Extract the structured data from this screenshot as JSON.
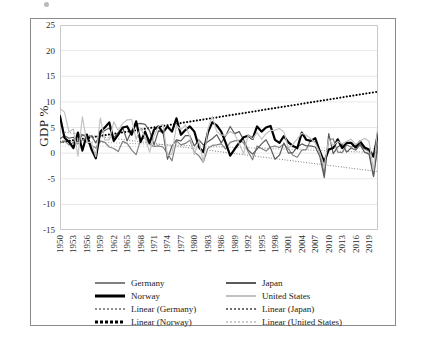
{
  "figure": {
    "ylabel": "GDP %",
    "title": ""
  },
  "chart_data": {
    "type": "line",
    "title": "",
    "xlabel": "",
    "ylabel": "GDP %",
    "ylim": [
      -15,
      25
    ],
    "ytick_values": [
      25,
      20,
      15,
      10,
      5,
      0,
      -5,
      -10,
      -15
    ],
    "ytick_labels": [
      "25",
      "20",
      "15",
      "10",
      "5",
      "0",
      "-5",
      "-10",
      "-15"
    ],
    "grid": "horizontal",
    "legend_position": "below",
    "x_start": 1950,
    "x_end": 2021,
    "xtick_labels": [
      "1950",
      "1953",
      "1956",
      "1959",
      "1962",
      "1965",
      "1968",
      "1971",
      "1974",
      "1977",
      "1980",
      "1983",
      "1986",
      "1989",
      "1992",
      "1995",
      "1998",
      "2001",
      "2004",
      "2007",
      "2010",
      "2013",
      "2016",
      "2019"
    ],
    "xtick_step": 3,
    "x": [
      1950,
      1951,
      1952,
      1953,
      1954,
      1955,
      1956,
      1957,
      1958,
      1959,
      1960,
      1961,
      1962,
      1963,
      1964,
      1965,
      1966,
      1967,
      1968,
      1969,
      1970,
      1971,
      1972,
      1973,
      1974,
      1975,
      1976,
      1977,
      1978,
      1979,
      1980,
      1981,
      1982,
      1983,
      1984,
      1985,
      1986,
      1987,
      1988,
      1989,
      1990,
      1991,
      1992,
      1993,
      1994,
      1995,
      1996,
      1997,
      1998,
      1999,
      2000,
      2001,
      2002,
      2003,
      2004,
      2005,
      2006,
      2007,
      2008,
      2009,
      2010,
      2011,
      2012,
      2013,
      2014,
      2015,
      2016,
      2017,
      2018,
      2019,
      2020,
      2021
    ],
    "series": [
      {
        "name": "Germany",
        "color": "#808080",
        "width": 1.2,
        "style": "solid",
        "values": [
          2.0,
          2.4,
          1.6,
          2.1,
          1.8,
          2.6,
          2.2,
          1.5,
          1.0,
          2.4,
          2.1,
          1.2,
          0.9,
          0.3,
          2.3,
          1.9,
          0.6,
          -0.3,
          2.6,
          3.0,
          1.7,
          1.3,
          1.4,
          1.2,
          -0.1,
          -1.5,
          2.4,
          1.6,
          1.9,
          2.5,
          0.2,
          -0.5,
          -1.8,
          0.9,
          1.5,
          1.6,
          1.8,
          0.8,
          2.1,
          2.4,
          2.5,
          2.0,
          0.3,
          -1.3,
          1.4,
          0.9,
          0.4,
          1.2,
          1.4,
          1.1,
          1.8,
          0.8,
          -0.4,
          -0.8,
          0.6,
          0.7,
          2.6,
          2.1,
          0.6,
          -4.3,
          2.6,
          2.8,
          0.2,
          0.1,
          1.6,
          1.2,
          1.4,
          1.7,
          0.8,
          0.4,
          -4.4,
          2.2
        ]
      },
      {
        "name": "Japan",
        "color": "#5a5a5a",
        "width": 1.2,
        "style": "solid",
        "values": [
          2.8,
          3.4,
          2.9,
          3.1,
          2.2,
          3.6,
          3.1,
          3.4,
          2.0,
          3.8,
          4.4,
          4.9,
          3.0,
          4.0,
          5.0,
          2.4,
          4.4,
          5.6,
          5.8,
          5.6,
          4.4,
          1.6,
          4.4,
          4.0,
          -1.2,
          1.4,
          2.6,
          2.4,
          3.4,
          3.4,
          1.4,
          2.6,
          1.6,
          2.2,
          2.8,
          3.6,
          2.0,
          3.4,
          5.2,
          3.8,
          4.2,
          2.6,
          0.6,
          -0.2,
          0.8,
          1.8,
          2.6,
          1.0,
          -1.2,
          -0.4,
          2.0,
          0.0,
          0.1,
          1.2,
          1.8,
          1.4,
          1.4,
          1.2,
          -0.6,
          -4.8,
          3.8,
          -0.1,
          1.2,
          1.8,
          0.2,
          1.0,
          0.6,
          1.6,
          0.2,
          -0.2,
          -4.6,
          1.6
        ]
      },
      {
        "name": "Norway",
        "color": "#000000",
        "width": 2.2,
        "style": "solid",
        "values": [
          7.2,
          3.0,
          2.2,
          1.0,
          4.0,
          0.5,
          3.6,
          0.8,
          -1.0,
          4.2,
          5.0,
          6.0,
          2.4,
          3.6,
          5.0,
          5.2,
          3.6,
          6.2,
          2.2,
          4.2,
          2.0,
          4.6,
          5.2,
          4.0,
          5.2,
          4.2,
          6.8,
          3.6,
          4.5,
          5.2,
          4.2,
          1.2,
          0.2,
          4.0,
          6.0,
          5.4,
          4.2,
          2.0,
          -0.5,
          0.8,
          2.0,
          3.1,
          3.4,
          2.8,
          5.2,
          4.2,
          5.0,
          5.3,
          2.6,
          2.0,
          3.3,
          2.1,
          1.4,
          1.0,
          4.0,
          2.6,
          2.4,
          2.9,
          0.4,
          -1.7,
          0.7,
          1.0,
          2.7,
          1.0,
          2.0,
          2.0,
          1.1,
          2.3,
          1.1,
          0.7,
          -0.7,
          3.9
        ],
        "note": "Heavy black series; values rescaled to match plotted trajectory"
      },
      {
        "name": "United States",
        "color": "#c2c2c2",
        "width": 1.2,
        "style": "solid",
        "values": [
          8.7,
          8.0,
          4.1,
          4.7,
          -0.6,
          7.1,
          2.1,
          2.1,
          -0.7,
          6.9,
          2.6,
          2.6,
          6.1,
          4.4,
          5.8,
          6.5,
          6.6,
          2.7,
          4.9,
          3.1,
          0.2,
          3.3,
          5.3,
          5.6,
          -0.5,
          -0.2,
          5.4,
          4.6,
          5.5,
          3.2,
          -0.3,
          2.5,
          -1.8,
          4.6,
          7.2,
          4.2,
          3.5,
          3.5,
          4.2,
          3.7,
          1.9,
          -0.1,
          3.5,
          2.8,
          4.0,
          2.7,
          3.8,
          4.4,
          4.5,
          4.8,
          4.1,
          1.0,
          1.7,
          2.8,
          3.9,
          3.5,
          2.8,
          2.0,
          0.1,
          -2.6,
          2.7,
          1.5,
          2.3,
          1.8,
          2.3,
          2.7,
          1.7,
          2.3,
          2.9,
          2.3,
          -3.4,
          5.7
        ]
      }
    ],
    "trendlines": [
      {
        "name": "Linear (Germany)",
        "color": "#8f8f8f",
        "style": "dotted",
        "width": 1.0,
        "y_start": 2.4,
        "y_end": 0.1
      },
      {
        "name": "Linear (Japan)",
        "color": "#707070",
        "style": "dotted",
        "width": 1.0,
        "y_start": 4.2,
        "y_end": -3.6
      },
      {
        "name": "Linear (Norway)",
        "color": "#000000",
        "style": "dotted",
        "width": 2.0,
        "y_start": 2.1,
        "y_end": 12.0
      },
      {
        "name": "Linear (United States)",
        "color": "#cccccc",
        "style": "dotted",
        "width": 1.0,
        "y_start": 1.4,
        "y_end": 0.9
      }
    ]
  },
  "legend": {
    "items": [
      {
        "label": "Germany",
        "color": "#808080",
        "style": "solid",
        "width": 2
      },
      {
        "label": "Japan",
        "color": "#5a5a5a",
        "style": "solid",
        "width": 2
      },
      {
        "label": "Norway",
        "color": "#000000",
        "style": "solid",
        "width": 3
      },
      {
        "label": "United States",
        "color": "#c2c2c2",
        "style": "solid",
        "width": 2
      },
      {
        "label": "Linear (Germany)",
        "color": "#8f8f8f",
        "style": "dotted",
        "width": 2
      },
      {
        "label": "Linear (Japan)",
        "color": "#707070",
        "style": "dotted",
        "width": 2
      },
      {
        "label": "Linear (Norway)",
        "color": "#000000",
        "style": "dotted",
        "width": 3
      },
      {
        "label": "Linear (United States)",
        "color": "#cccccc",
        "style": "dotted",
        "width": 2
      }
    ]
  }
}
